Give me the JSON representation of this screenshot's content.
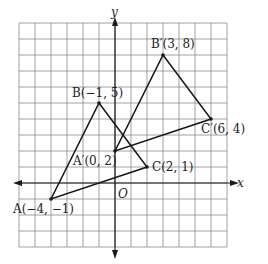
{
  "diagram": {
    "type": "coordinate-plane-transformation",
    "axes": {
      "x_label": "x",
      "y_label": "y",
      "origin_label": "O"
    },
    "grid": {
      "x_min": -6,
      "x_max": 7,
      "y_min": -4,
      "y_max": 10,
      "step": 1
    },
    "colors": {
      "grid": "#8a8a8a",
      "lines": "#1a1a1a",
      "text": "#222222"
    },
    "triangles": [
      {
        "name": "ABC",
        "vertices": [
          {
            "label": "A(−4, −1)",
            "x": -4,
            "y": -1
          },
          {
            "label": "B(−1, 5)",
            "x": -1,
            "y": 5
          },
          {
            "label": "C(2, 1)",
            "x": 2,
            "y": 1
          }
        ]
      },
      {
        "name": "A'B'C'",
        "vertices": [
          {
            "label": "A′(0, 2)",
            "x": 0,
            "y": 2
          },
          {
            "label": "B′(3, 8)",
            "x": 3,
            "y": 8
          },
          {
            "label": "C′(6, 4)",
            "x": 6,
            "y": 4
          }
        ]
      }
    ],
    "connectors": [
      {
        "from": "A",
        "to": "C′"
      }
    ]
  }
}
